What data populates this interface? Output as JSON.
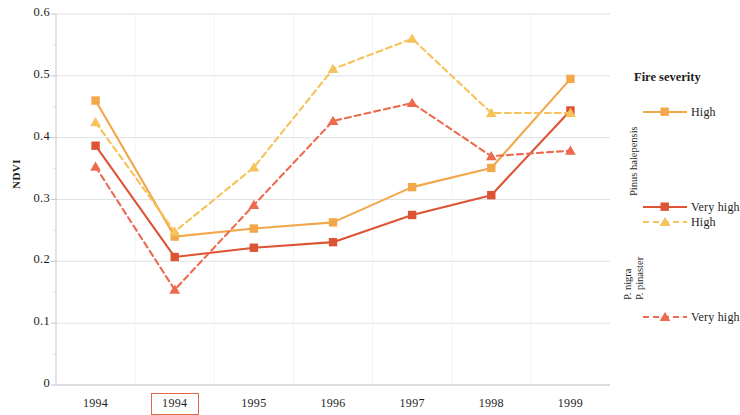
{
  "chart_data": {
    "type": "line",
    "title": "",
    "xlabel": "",
    "ylabel": "NDVI",
    "x_categories": [
      "1994",
      "1994",
      "1995",
      "1996",
      "1997",
      "1998",
      "1999"
    ],
    "x_highlighted_index": 1,
    "ylim": [
      0,
      0.6
    ],
    "y_ticks": [
      "0",
      "0.1",
      "0.2",
      "0.3",
      "0.4",
      "0.5",
      "0.6"
    ],
    "y_tick_values": [
      0,
      0.1,
      0.2,
      0.3,
      0.4,
      0.5,
      0.6
    ],
    "grid": "horizontal",
    "legend_position": "right",
    "series": [
      {
        "name": "High",
        "group": "Pinus halepensis",
        "style": "solid",
        "marker": "square",
        "color": "#F2A74B",
        "values": [
          0.46,
          0.24,
          0.253,
          0.263,
          0.32,
          0.351,
          0.495
        ]
      },
      {
        "name": "Very high",
        "group": "Pinus halepensis",
        "style": "solid",
        "marker": "square",
        "color": "#DD5435",
        "values": [
          0.387,
          0.207,
          0.222,
          0.231,
          0.275,
          0.307,
          0.444
        ]
      },
      {
        "name": "High",
        "group": "P. nigra / P. pinaster",
        "style": "dashed",
        "marker": "triangle",
        "color": "#F6C25C",
        "values": [
          0.425,
          0.248,
          0.352,
          0.511,
          0.56,
          0.44,
          0.44
        ]
      },
      {
        "name": "Very high",
        "group": "P. nigra / P. pinaster",
        "style": "dashed",
        "marker": "triangle",
        "color": "#EC6A4E",
        "values": [
          0.353,
          0.154,
          0.291,
          0.427,
          0.456,
          0.37,
          0.379
        ]
      }
    ]
  },
  "axis": {
    "y_title": "NDVI",
    "y_labels": [
      "0.6",
      "0.5",
      "0.4",
      "0.3",
      "0.2",
      "0.1",
      "0"
    ],
    "x_labels": [
      "1994",
      "1994",
      "1995",
      "1996",
      "1997",
      "1998",
      "1999"
    ]
  },
  "legend": {
    "title": "Fire severity",
    "groups": [
      {
        "label": "Pinus halepensis",
        "label_lines": [
          "Pinus halepensis"
        ],
        "entries": [
          {
            "label": "High",
            "color": "#F2A74B",
            "style": "solid",
            "marker": "square"
          },
          {
            "label": "Very high",
            "color": "#DD5435",
            "style": "solid",
            "marker": "square"
          }
        ]
      },
      {
        "label": "P. nigra / P. pinaster",
        "label_lines": [
          "P. nigra",
          "P. pinaster"
        ],
        "entries": [
          {
            "label": "High",
            "color": "#F6C25C",
            "style": "dashed",
            "marker": "triangle"
          },
          {
            "label": "Very high",
            "color": "#EC6A4E",
            "style": "dashed",
            "marker": "triangle"
          }
        ]
      }
    ]
  },
  "colors": {
    "halepensis_high": "#F2A74B",
    "halepensis_very_high": "#DD5435",
    "nigra_high": "#F6C25C",
    "nigra_very_high": "#EC6A4E",
    "highlight_box": "#E2694A",
    "grid": "#d9d9de",
    "axis": "#c8c8cf"
  }
}
